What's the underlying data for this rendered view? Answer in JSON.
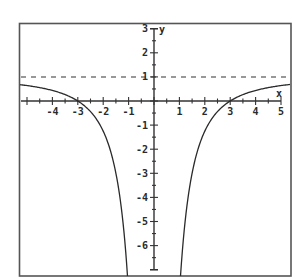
{
  "chart_data": {
    "type": "line",
    "title": "",
    "xlabel": "x",
    "ylabel": "y",
    "xlim": [
      -5.3,
      5.4
    ],
    "ylim": [
      -7.2,
      3.3
    ],
    "grid": false,
    "legend": null,
    "x_ticks": [
      -4,
      -3,
      -2,
      -1,
      1,
      2,
      3,
      4,
      5
    ],
    "x_tick_labels": [
      "-4",
      "-3",
      "-2",
      "-1",
      "1",
      "2",
      "3",
      "4",
      "5"
    ],
    "y_ticks": [
      3,
      2,
      1,
      -1,
      -2,
      -3,
      -4,
      -5,
      -6
    ],
    "y_tick_labels": [
      "3",
      "2",
      "1",
      "-1",
      "-2",
      "-3",
      "-4",
      "-5",
      "-6"
    ],
    "minor_tick_step": 0.5,
    "series": [
      {
        "name": "f(x) = 1 - 9/x^2",
        "style": "solid",
        "branches": [
          {
            "x": [
              -5.3,
              -5,
              -4.5,
              -4,
              -3.5,
              -3,
              -2.5,
              -2,
              -1.75,
              -1.5,
              -1.3,
              -1.15,
              -1.06
            ],
            "y": [
              0.68,
              0.64,
              0.56,
              0.44,
              0.27,
              0.0,
              -0.44,
              -1.25,
              -1.94,
              -3.0,
              -4.33,
              -5.81,
              -7.0
            ]
          },
          {
            "x": [
              1.06,
              1.15,
              1.3,
              1.5,
              1.75,
              2,
              2.5,
              3,
              3.5,
              4,
              4.5,
              5,
              5.3
            ],
            "y": [
              -7.0,
              -5.81,
              -4.33,
              -3.0,
              -1.94,
              -1.25,
              -0.44,
              0.0,
              0.27,
              0.44,
              0.56,
              0.64,
              0.68
            ]
          }
        ]
      },
      {
        "name": "horizontal asymptote y = 1",
        "style": "dashed",
        "x": [
          -5.3,
          5.4
        ],
        "y": [
          1,
          1
        ]
      }
    ],
    "annotations": [
      "x-intercepts at x = -3 and x = 3",
      "vertical asymptote at x = 0"
    ]
  },
  "axes": {
    "x_label": "x",
    "y_label": "y"
  }
}
